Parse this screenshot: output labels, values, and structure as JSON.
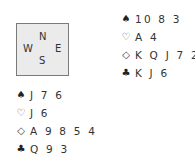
{
  "compass": {
    "north": "N",
    "west": "W",
    "east": "E",
    "south": "S"
  },
  "hands": {
    "north": {
      "spades": "10 8 3",
      "hearts": "A 4",
      "diamonds": "K Q J 7 2",
      "clubs": "K J 6"
    },
    "west": {
      "spades": "J 7 6",
      "hearts": "J 6",
      "diamonds": "A 9 8 5 4",
      "clubs": "Q 9 3"
    }
  },
  "suit_symbols": {
    "spades": "♠",
    "hearts": "♡",
    "diamonds": "◇",
    "clubs": "♣"
  }
}
